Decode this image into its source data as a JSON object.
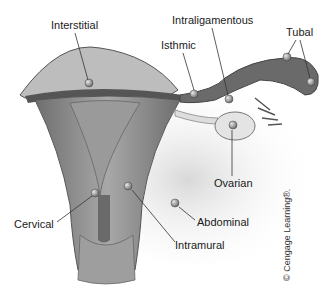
{
  "figure": {
    "labels": {
      "interstitial": "Interstitial",
      "isthmic": "Isthmic",
      "intraligamentous": "Intraligamentous",
      "tubal": "Tubal",
      "ovarian": "Ovarian",
      "abdominal": "Abdominal",
      "cervical": "Cervical",
      "intramural": "Intramural"
    },
    "credit": "© Cengage Learning®."
  },
  "colors": {
    "tissue_dark": "#5a5a5a",
    "tissue_mid": "#8c8c8c",
    "tissue_light": "#c4c4c4",
    "peritoneum": "#e2e2e2",
    "leader_line": "#333333"
  }
}
